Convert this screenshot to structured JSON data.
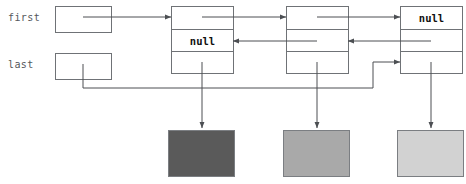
{
  "diagram": {
    "kind": "doubly-linked-list",
    "background_color": "#ffffff",
    "line_color": "#4c4f53",
    "box_stroke_color": "#6f7276",
    "label_color": "#55585c",
    "null_text_color": "#111111"
  },
  "references": [
    {
      "id": "first",
      "label": "first",
      "label_x": 8,
      "label_y": 17,
      "box": {
        "x": 55,
        "y": 6,
        "w": 56,
        "h": 26
      },
      "stub": {
        "x1": 83,
        "y1": 17,
        "x2": 111,
        "y2": 17
      }
    },
    {
      "id": "last",
      "label": "last",
      "label_x": 8,
      "label_y": 64,
      "box": {
        "x": 55,
        "y": 53,
        "w": 56,
        "h": 26
      },
      "stub": {
        "x1": 83,
        "y1": 64,
        "x2": 83,
        "y2": 88
      }
    }
  ],
  "nodes": [
    {
      "id": "node-1",
      "index": 0,
      "box": {
        "x": 171,
        "y": 6,
        "w": 62,
        "h": 67
      },
      "rows": [
        {
          "role": "next",
          "text": ""
        },
        {
          "role": "prev",
          "text": "null"
        },
        {
          "role": "data",
          "text": ""
        }
      ]
    },
    {
      "id": "node-2",
      "index": 1,
      "box": {
        "x": 286,
        "y": 6,
        "w": 62,
        "h": 67
      },
      "rows": [
        {
          "role": "next",
          "text": ""
        },
        {
          "role": "prev",
          "text": ""
        },
        {
          "role": "data",
          "text": ""
        }
      ]
    },
    {
      "id": "node-3",
      "index": 2,
      "box": {
        "x": 400,
        "y": 6,
        "w": 62,
        "h": 67
      },
      "rows": [
        {
          "role": "next",
          "text": "null"
        },
        {
          "role": "prev",
          "text": ""
        },
        {
          "role": "data",
          "text": ""
        }
      ]
    }
  ],
  "data_objects": [
    {
      "id": "object-1",
      "color": "#5a5a5a",
      "rect": {
        "x": 168,
        "y": 130,
        "w": 66,
        "h": 46
      }
    },
    {
      "id": "object-2",
      "color": "#a9a9a9",
      "rect": {
        "x": 283,
        "y": 130,
        "w": 66,
        "h": 46
      }
    },
    {
      "id": "object-3",
      "color": "#d2d2d2",
      "rect": {
        "x": 397,
        "y": 130,
        "w": 66,
        "h": 46
      }
    }
  ],
  "connections": [
    {
      "id": "first-to-node1",
      "kind": "next",
      "from": "first",
      "to": "node-1"
    },
    {
      "id": "node1-next-node2",
      "kind": "next",
      "from": "node-1",
      "to": "node-2"
    },
    {
      "id": "node2-next-node3",
      "kind": "next",
      "from": "node-2",
      "to": "node-3"
    },
    {
      "id": "node2-prev-node1",
      "kind": "prev",
      "from": "node-2",
      "to": "node-1"
    },
    {
      "id": "node3-prev-node2",
      "kind": "prev",
      "from": "node-3",
      "to": "node-2"
    },
    {
      "id": "last-to-node3",
      "kind": "last-ref",
      "from": "last",
      "to": "node-3"
    },
    {
      "id": "node1-data-object1",
      "kind": "data",
      "from": "node-1",
      "to": "object-1"
    },
    {
      "id": "node2-data-object2",
      "kind": "data",
      "from": "node-2",
      "to": "object-2"
    },
    {
      "id": "node3-data-object3",
      "kind": "data",
      "from": "node-3",
      "to": "object-3"
    }
  ]
}
